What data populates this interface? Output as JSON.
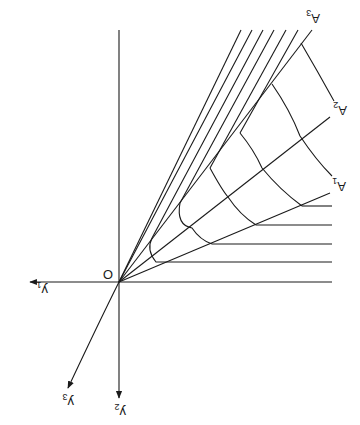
{
  "diagram": {
    "orientation": "rotated 180 degrees",
    "origin_label": "O",
    "axes": [
      {
        "id": "y1",
        "label": "y",
        "sub": "1"
      },
      {
        "id": "y2",
        "label": "y",
        "sub": "2"
      },
      {
        "id": "y3",
        "label": "y",
        "sub": "3"
      }
    ],
    "rays": [
      {
        "id": "A1",
        "label": "A",
        "sub": "1"
      },
      {
        "id": "A2",
        "label": "A",
        "sub": "2"
      },
      {
        "id": "A3",
        "label": "A",
        "sub": "3"
      }
    ],
    "horizontal_line_count": 5,
    "diagonal_line_count": 6,
    "arc_count": 4,
    "color": "#1a1a1a"
  }
}
